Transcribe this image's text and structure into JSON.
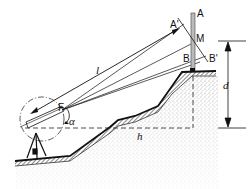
{
  "diagram": {
    "type": "surveying-tacheometry-cross-section",
    "labels": {
      "A": "A",
      "A_prime": "A'",
      "M": "M",
      "B": "B",
      "B_prime": "B'",
      "F": "F",
      "alpha": "α",
      "l": "l",
      "d": "d",
      "h": "h"
    },
    "colors": {
      "ink": "#111111",
      "ground_fill": "#d8d8d8",
      "background": "#ffffff"
    }
  }
}
